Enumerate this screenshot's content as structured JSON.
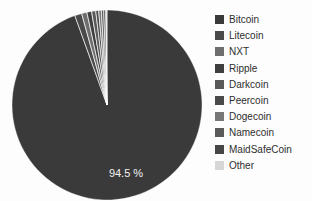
{
  "chart_data": {
    "type": "pie",
    "title": "",
    "categories": [
      "Bitcoin",
      "Litecoin",
      "NXT",
      "Ripple",
      "Darkcoin",
      "Peercoin",
      "Dogecoin",
      "Namecoin",
      "MaidSafeCoin",
      "Other"
    ],
    "values": [
      94.5,
      1.2,
      0.9,
      0.8,
      0.7,
      0.5,
      0.45,
      0.4,
      0.35,
      0.2
    ],
    "unit": "%",
    "data_labels": [
      "94.5 %",
      "",
      "",
      "",
      "",
      "",
      "",
      "",
      "",
      ""
    ],
    "colors": [
      "#3a3a3a",
      "#4a4a4a",
      "#6e6e6e",
      "#3f3f3f",
      "#595959",
      "#4a4a4a",
      "#777777",
      "#5a5a5a",
      "#464646",
      "#d6d6d6"
    ],
    "start_angle_deg": -90,
    "direction": "clockwise",
    "legend_position": "right",
    "grid": false,
    "background": "#fdfdfd"
  },
  "pie": {
    "center_x": 107,
    "center_y": 105,
    "radius": 95,
    "main_label": "94.5 %",
    "main_label_x": 126,
    "main_label_y": 177
  },
  "legend": {
    "items": [
      {
        "label": "Bitcoin",
        "color": "#3a3a3a"
      },
      {
        "label": "Litecoin",
        "color": "#4a4a4a"
      },
      {
        "label": "NXT",
        "color": "#6e6e6e"
      },
      {
        "label": "Ripple",
        "color": "#3f3f3f"
      },
      {
        "label": "Darkcoin",
        "color": "#595959"
      },
      {
        "label": "Peercoin",
        "color": "#4a4a4a"
      },
      {
        "label": "Dogecoin",
        "color": "#777777"
      },
      {
        "label": "Namecoin",
        "color": "#5a5a5a"
      },
      {
        "label": "MaidSafeCoin",
        "color": "#464646"
      },
      {
        "label": "Other",
        "color": "#d6d6d6"
      }
    ]
  }
}
